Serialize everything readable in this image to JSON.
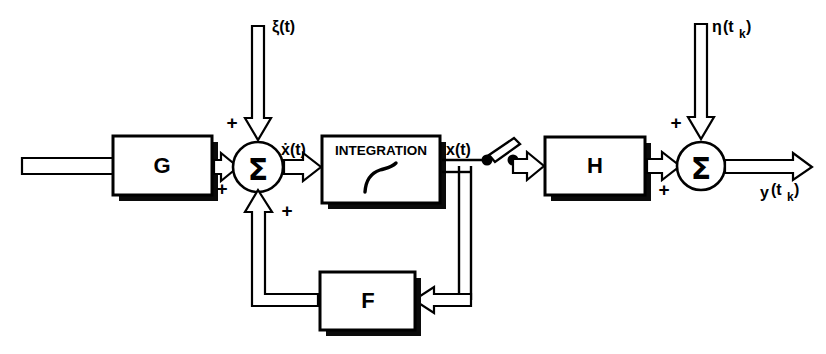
{
  "figure": {
    "kind": "control-system-block-diagram",
    "background_color": "#ffffff",
    "line_color": "#000000",
    "canvas": {
      "width": 826,
      "height": 354
    }
  },
  "blocks": [
    {
      "id": "G",
      "label": "G",
      "x": 113,
      "y": 136,
      "w": 99,
      "h": 59
    },
    {
      "id": "INTEGRATION",
      "label": "INTEGRATION",
      "glyph": "integral-sign",
      "x": 322,
      "y": 136,
      "w": 118,
      "h": 67
    },
    {
      "id": "F",
      "label": "F",
      "x": 320,
      "y": 272,
      "w": 95,
      "h": 58
    },
    {
      "id": "H",
      "label": "H",
      "x": 545,
      "y": 137,
      "w": 100,
      "h": 58
    }
  ],
  "summing_junctions": [
    {
      "id": "sum-left",
      "glyph": "Σ",
      "cx": 258,
      "cy": 167,
      "r": 25,
      "signs": [
        {
          "label": "+",
          "position": "top-left"
        },
        {
          "label": "+",
          "position": "bottom-left"
        },
        {
          "label": "+",
          "position": "bottom-right"
        }
      ]
    },
    {
      "id": "sum-right",
      "glyph": "Σ",
      "cx": 701,
      "cy": 166,
      "r": 24,
      "signs": [
        {
          "label": "+",
          "position": "top-left"
        },
        {
          "label": "+",
          "position": "bottom-left"
        }
      ]
    }
  ],
  "signals": {
    "input_u": {
      "text": "u (t)",
      "x": 22,
      "y": 148
    },
    "noise_xi": {
      "text": "ξ(t)",
      "x": 272,
      "y": 32
    },
    "state_dot": {
      "text": "ẋ(t)",
      "x": 282,
      "y": 155
    },
    "state_x": {
      "text": "x(t)",
      "x": 447,
      "y": 155
    },
    "noise_eta_main": {
      "text": "η",
      "x": 712,
      "y": 28
    },
    "noise_eta_arg": {
      "text": "(t",
      "x": 724,
      "y": 28
    },
    "noise_eta_sub": {
      "text": "k",
      "x": 740,
      "y": 34
    },
    "noise_eta_close": {
      "text": ")",
      "x": 746,
      "y": 28
    },
    "output_y_main": {
      "text": "y",
      "x": 762,
      "y": 194
    },
    "output_y_arg": {
      "text": "(t",
      "x": 774,
      "y": 191
    },
    "output_y_sub": {
      "text": "k",
      "x": 790,
      "y": 197
    },
    "output_y_close": {
      "text": ")",
      "x": 797,
      "y": 191
    }
  },
  "switch": {
    "id": "sampler-switch",
    "name": "sampling-switch",
    "pivot": {
      "x": 487,
      "y": 160
    },
    "contact": {
      "x": 512,
      "y": 159
    },
    "state": "open"
  },
  "labels": {
    "sum_symbol": "Σ",
    "plus": "+",
    "integral": "∫"
  }
}
